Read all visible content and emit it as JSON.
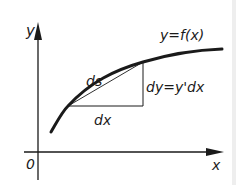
{
  "diagram": {
    "labels": {
      "y_axis": "y",
      "x_axis": "x",
      "origin": "0",
      "curve": "y=f(x)",
      "arc": "ds",
      "dx": "dx",
      "dy": "dy=y'dx"
    },
    "colors": {
      "ink": "#1a1a1a",
      "background": "#ffffff"
    }
  }
}
